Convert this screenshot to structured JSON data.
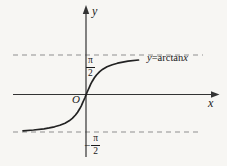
{
  "figure": {
    "background": "#f7f6f3",
    "width": 227,
    "height": 166
  },
  "labels": {
    "y_axis": "y",
    "x_axis": "x",
    "origin": "O",
    "equation": {
      "lhs": "y",
      "eq": "=",
      "fn": "arctan",
      "arg": "x"
    },
    "upper_asymptote": {
      "numerator": "π",
      "denominator": "2"
    },
    "lower_asymptote": {
      "sign": "−",
      "numerator": "π",
      "denominator": "2"
    }
  },
  "colors": {
    "curve": "#222222",
    "axis": "#333333",
    "asymptote_dash": "#8f8f8f",
    "text": "#1a1a1a"
  },
  "chart_data": {
    "type": "line",
    "title": "",
    "function": "y = arctan(x)",
    "xlabel": "x",
    "ylabel": "y",
    "legend": "none",
    "grid": false,
    "x_range": [
      -6,
      5
    ],
    "y_range": [
      -1.5708,
      1.5708
    ],
    "asymptotes": {
      "upper_y": 1.5708,
      "lower_y": -1.5708,
      "upper_label": "π/2",
      "lower_label": "−π/2",
      "style": "dashed"
    },
    "points": [
      [
        -6,
        -1.4056
      ],
      [
        -5,
        -1.3734
      ],
      [
        -4,
        -1.3258
      ],
      [
        -3.5,
        -1.2925
      ],
      [
        -3,
        -1.249
      ],
      [
        -2.5,
        -1.1903
      ],
      [
        -2,
        -1.1071
      ],
      [
        -1.6,
        -1.0122
      ],
      [
        -1.3,
        -0.9151
      ],
      [
        -1,
        -0.7854
      ],
      [
        -0.8,
        -0.6747
      ],
      [
        -0.6,
        -0.5404
      ],
      [
        -0.45,
        -0.4229
      ],
      [
        -0.3,
        -0.2915
      ],
      [
        -0.2,
        -0.1974
      ],
      [
        -0.1,
        -0.0997
      ],
      [
        0,
        0
      ],
      [
        0.1,
        0.0997
      ],
      [
        0.2,
        0.1974
      ],
      [
        0.3,
        0.2915
      ],
      [
        0.45,
        0.4229
      ],
      [
        0.6,
        0.5404
      ],
      [
        0.8,
        0.6747
      ],
      [
        1,
        0.7854
      ],
      [
        1.3,
        0.9151
      ],
      [
        1.6,
        1.0122
      ],
      [
        2,
        1.1071
      ],
      [
        2.5,
        1.1903
      ],
      [
        3,
        1.249
      ],
      [
        3.5,
        1.2925
      ],
      [
        4,
        1.3258
      ],
      [
        5,
        1.3734
      ]
    ],
    "layout": {
      "origin_px": [
        86,
        95
      ],
      "px_per_x_unit": 10.5,
      "px_per_y_unit": 25.46,
      "upper_asymptote_y_px": 55,
      "lower_asymptote_y_px": 132
    }
  }
}
